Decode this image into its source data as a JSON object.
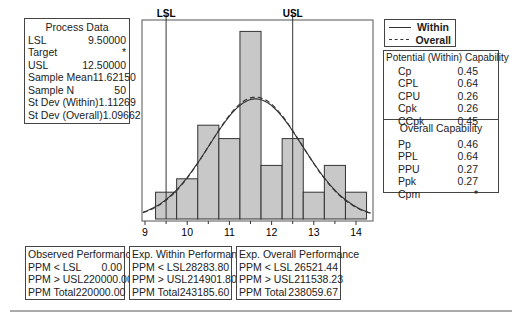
{
  "process_data": {
    "title": "Process Data",
    "rows": [
      {
        "label": "LSL",
        "value": "9.50000"
      },
      {
        "label": "Target",
        "value": "*"
      },
      {
        "label": "USL",
        "value": "12.50000"
      },
      {
        "label": "Sample Mean",
        "value": "11.62150"
      },
      {
        "label": "Sample N",
        "value": "50"
      },
      {
        "label": "St Dev (Within)",
        "value": "1.11269"
      },
      {
        "label": "St Dev (Overall)",
        "value": "1.09662"
      }
    ]
  },
  "legend": {
    "within_label": "Within",
    "overall_label": "Overall"
  },
  "potential_capability": {
    "title": "Potential (Within) Capability",
    "rows": [
      {
        "label": "Cp",
        "value": "0.45"
      },
      {
        "label": "CPL",
        "value": "0.64"
      },
      {
        "label": "CPU",
        "value": "0.26"
      },
      {
        "label": "Cpk",
        "value": "0.26"
      },
      {
        "label": "CCpk",
        "value": "0.45"
      }
    ]
  },
  "overall_capability": {
    "title": "Overall Capability",
    "rows": [
      {
        "label": "Pp",
        "value": "0.46"
      },
      {
        "label": "PPL",
        "value": "0.64"
      },
      {
        "label": "PPU",
        "value": "0.27"
      },
      {
        "label": "Ppk",
        "value": "0.27"
      },
      {
        "label": "Cpm",
        "value": "*"
      }
    ]
  },
  "observed_performance": {
    "title": "Observed Performance",
    "rows": [
      {
        "label": "PPM < LSL",
        "value": "0.00"
      },
      {
        "label": "PPM > USL",
        "value": "220000.00"
      },
      {
        "label": "PPM Total",
        "value": "220000.00"
      }
    ]
  },
  "exp_within_performance": {
    "title": "Exp. Within Performance",
    "rows": [
      {
        "label": "PPM < LSL",
        "value": "28283.80"
      },
      {
        "label": "PPM > USL",
        "value": "214901.80"
      },
      {
        "label": "PPM Total",
        "value": "243185.60"
      }
    ]
  },
  "exp_overall_performance": {
    "title": "Exp. Overall Performance",
    "rows": [
      {
        "label": "PPM < LSL",
        "value": "26521.44"
      },
      {
        "label": "PPM > USL",
        "value": "211538.23"
      },
      {
        "label": "PPM Total",
        "value": "238059.67"
      }
    ]
  },
  "chart_data": {
    "type": "bar",
    "xlabel": "",
    "ylabel": "",
    "categories": [
      "9.5",
      "10.0",
      "10.5",
      "11.0",
      "11.5",
      "12.0",
      "12.5",
      "13.0",
      "13.5",
      "14.0"
    ],
    "bin_width": 0.5,
    "values": [
      2,
      3,
      7,
      6,
      14,
      4,
      6,
      2,
      4,
      2
    ],
    "x_ticks": [
      "9",
      "10",
      "11",
      "12",
      "13",
      "14"
    ],
    "xlim": [
      8.95,
      14.4
    ],
    "spec_limits": {
      "LSL": 9.5,
      "USL": 12.5,
      "LSL_label": "LSL",
      "USL_label": "USL"
    },
    "curves": [
      {
        "name": "Within",
        "style": "solid",
        "mean": 11.6215,
        "sd": 1.11269
      },
      {
        "name": "Overall",
        "style": "dashed",
        "mean": 11.6215,
        "sd": 1.09662
      }
    ],
    "bar_color": "#c8c8c8",
    "grid": false
  }
}
